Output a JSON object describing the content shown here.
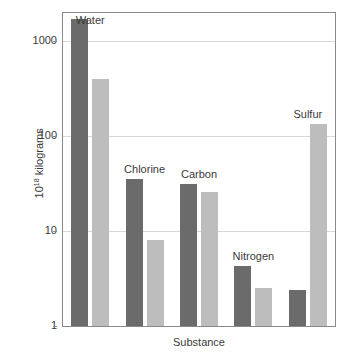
{
  "chart_data": {
    "type": "bar",
    "title": "",
    "subtitle": "",
    "xlabel": "Substance",
    "ylabel_text": "kilograms",
    "ylabel_base": "10",
    "ylabel_exponent": "18",
    "ylabel_full": "10¹⁸ kilograms",
    "yscale": "log",
    "ylim": [
      1,
      2000
    ],
    "ytick_labels": [
      "1000",
      "100",
      "10",
      "1"
    ],
    "ytick_values": [
      1000,
      100,
      10,
      1
    ],
    "grid": "horizontal",
    "legend": "none",
    "legend_position": "none",
    "categories": [
      "Water",
      "Chlorine",
      "Carbon",
      "Nitrogen",
      "Sulfur"
    ],
    "series": [
      {
        "name": "dark",
        "color": "#6b6b6b",
        "values": [
          1700,
          35,
          31,
          4.3,
          2.4
        ]
      },
      {
        "name": "light",
        "color": "#bdbdbd",
        "values": [
          400,
          8,
          26,
          2.5,
          135
        ]
      }
    ],
    "annotations": [
      {
        "text": "Water",
        "category": "Water"
      },
      {
        "text": "Chlorine",
        "category": "Chlorine"
      },
      {
        "text": "Carbon",
        "category": "Carbon"
      },
      {
        "text": "Nitrogen",
        "category": "Nitrogen"
      },
      {
        "text": "Sulfur",
        "category": "Sulfur"
      }
    ]
  },
  "colors": {
    "dark_bar": "#6b6b6b",
    "light_bar": "#bdbdbd",
    "gridline": "#d8d8d8",
    "frame": "#8a8a8a",
    "text": "#3a3a3a",
    "background": "#ffffff"
  }
}
